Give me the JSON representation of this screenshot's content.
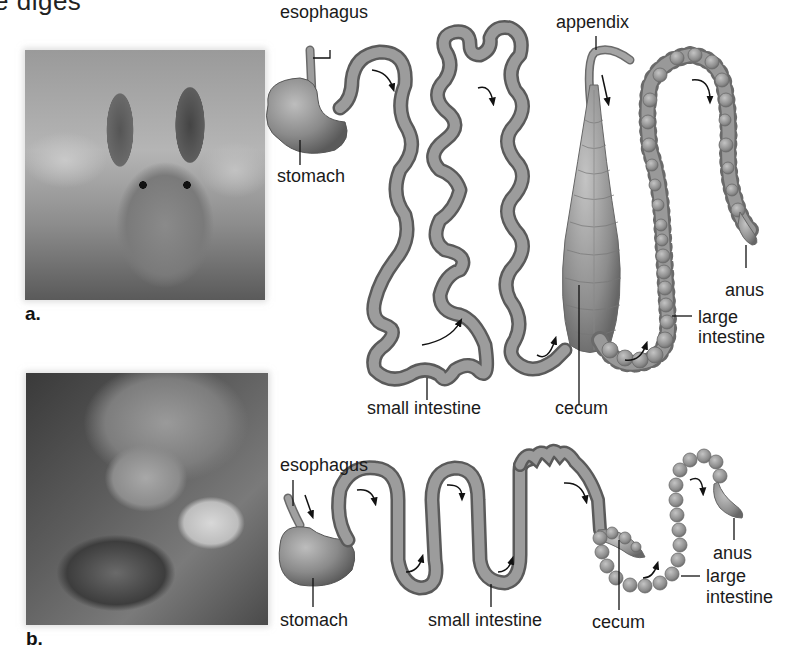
{
  "header": {
    "cut_off_text": "e diges"
  },
  "panels": [
    {
      "id": "a",
      "panel_label": "a.",
      "photo": "rabbit-photo",
      "labels": {
        "esophagus": "esophagus",
        "stomach": "stomach",
        "small_intestine": "small intestine",
        "appendix": "appendix",
        "cecum": "cecum",
        "anus": "anus",
        "large_intestine_1": "large",
        "large_intestine_2": "intestine"
      }
    },
    {
      "id": "b",
      "panel_label": "b.",
      "photo": "lion-photo",
      "labels": {
        "esophagus": "esophagus",
        "stomach": "stomach",
        "small_intestine": "small intestine",
        "cecum": "cecum",
        "anus": "anus",
        "large_intestine_1": "large",
        "large_intestine_2": "intestine"
      }
    }
  ],
  "colors": {
    "tract": "#8a8a8a",
    "tract_dark": "#5e5e5e",
    "tract_light": "#b8b8b8",
    "text": "#1a1a1a"
  }
}
